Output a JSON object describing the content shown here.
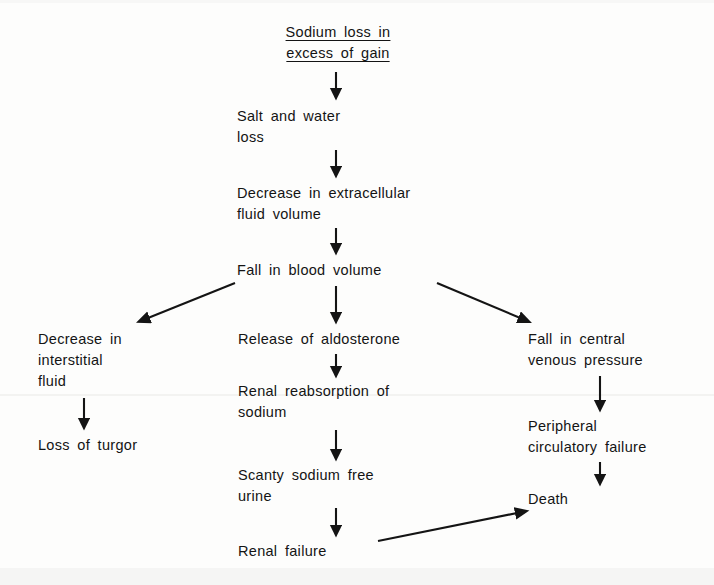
{
  "diagram": {
    "title_label": "Sodium loss in\nexcess of gain",
    "colors": {
      "ink": "#141414",
      "page": "#fdfdfc"
    },
    "nodes": {
      "sodium_loss": "Sodium loss in\nexcess of gain",
      "salt_water_loss": "Salt and water\nloss",
      "decrease_ecf": "Decrease in extracellular\nfluid volume",
      "fall_blood_volume": "Fall in blood volume",
      "decrease_interstitial": "Decrease in\ninterstitial\nfluid",
      "loss_of_turgor": "Loss of turgor",
      "release_aldosterone": "Release of aldosterone",
      "renal_reabsorption": "Renal reabsorption of\nsodium",
      "scanty_urine": "Scanty sodium free\nurine",
      "renal_failure": "Renal failure",
      "fall_cvp": "Fall in central\nvenous pressure",
      "peripheral_failure": "Peripheral\ncirculatory failure",
      "death": "Death"
    },
    "edges": [
      {
        "name": "sodium-loss-to-salt-water-loss",
        "from": "sodium_loss",
        "to": "salt_water_loss",
        "kind": "vertical"
      },
      {
        "name": "salt-water-loss-to-decrease-ecf",
        "from": "salt_water_loss",
        "to": "decrease_ecf",
        "kind": "vertical"
      },
      {
        "name": "decrease-ecf-to-fall-blood-volume",
        "from": "decrease_ecf",
        "to": "fall_blood_volume",
        "kind": "vertical"
      },
      {
        "name": "fall-blood-volume-to-decrease-interstitial",
        "from": "fall_blood_volume",
        "to": "decrease_interstitial",
        "kind": "diagonal-left"
      },
      {
        "name": "fall-blood-volume-to-release-aldosterone",
        "from": "fall_blood_volume",
        "to": "release_aldosterone",
        "kind": "vertical"
      },
      {
        "name": "fall-blood-volume-to-fall-cvp",
        "from": "fall_blood_volume",
        "to": "fall_cvp",
        "kind": "diagonal-right"
      },
      {
        "name": "decrease-interstitial-to-loss-of-turgor",
        "from": "decrease_interstitial",
        "to": "loss_of_turgor",
        "kind": "vertical"
      },
      {
        "name": "release-aldosterone-to-renal-reabsorption",
        "from": "release_aldosterone",
        "to": "renal_reabsorption",
        "kind": "vertical"
      },
      {
        "name": "renal-reabsorption-to-scanty-urine",
        "from": "renal_reabsorption",
        "to": "scanty_urine",
        "kind": "vertical"
      },
      {
        "name": "scanty-urine-to-renal-failure",
        "from": "scanty_urine",
        "to": "renal_failure",
        "kind": "vertical"
      },
      {
        "name": "renal-failure-to-death",
        "from": "renal_failure",
        "to": "death",
        "kind": "diagonal-up-right"
      },
      {
        "name": "fall-cvp-to-peripheral-failure",
        "from": "fall_cvp",
        "to": "peripheral_failure",
        "kind": "vertical"
      },
      {
        "name": "peripheral-failure-to-death",
        "from": "peripheral_failure",
        "to": "death",
        "kind": "vertical"
      }
    ]
  }
}
